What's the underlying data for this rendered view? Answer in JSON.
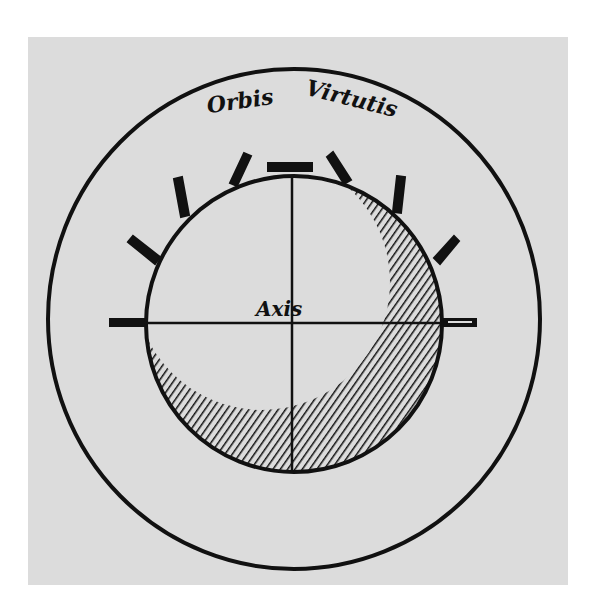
{
  "figure": {
    "title_words": [
      "Orbis",
      "Virtutis"
    ],
    "center_label": "Axis",
    "colors": {
      "paper": "#dcdcdc",
      "ink": "#111111",
      "background": "#ffffff"
    },
    "elements": {
      "outer_circle": "orbis-virtutis-ring",
      "inner_sphere": "sphere-with-shading",
      "rays": 8
    }
  }
}
